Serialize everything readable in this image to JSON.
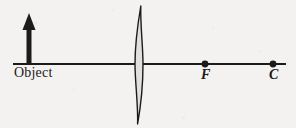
{
  "diagram": {
    "type": "ray-optics-lens-diagram",
    "background_color": "#f3f2f0",
    "ink_color": "#1b1b1b",
    "canvas": {
      "width": 296,
      "height": 128
    },
    "labels": {
      "object": "Object",
      "focal_point": "F",
      "center_of_curvature": "C"
    },
    "optical_axis": {
      "name": "principal-axis",
      "x_start": 13,
      "x_end": 286,
      "y": 64,
      "thickness": 2
    },
    "object_arrow": {
      "name": "object-arrow",
      "base_x": 29,
      "base_y": 64,
      "tip_y": 13,
      "height": 51,
      "shaft_width": 5,
      "head_width": 13,
      "head_height": 17,
      "direction": "up"
    },
    "lens": {
      "name": "converging-lens",
      "center_x": 139,
      "top_y": 6,
      "bottom_y": 124,
      "half_height": 59,
      "max_thickness": 8,
      "shape": "biconvex"
    },
    "points": [
      {
        "id": "F",
        "label": "F",
        "x": 205,
        "y": 64,
        "radius": 3.4
      },
      {
        "id": "C",
        "label": "C",
        "x": 273,
        "y": 64,
        "radius": 3.4
      }
    ]
  }
}
